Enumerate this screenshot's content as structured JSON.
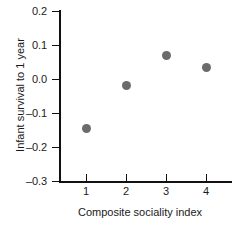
{
  "chart_data": {
    "type": "scatter",
    "title": "",
    "xlabel": "Composite sociality index",
    "ylabel": "Infant survival to 1 year",
    "x": [
      1,
      2,
      3,
      4
    ],
    "values": [
      -0.147,
      -0.018,
      0.068,
      0.035
    ],
    "series": [
      {
        "name": "Infant survival",
        "points": [
          {
            "x": 1,
            "y": -0.147
          },
          {
            "x": 2,
            "y": -0.018
          },
          {
            "x": 3,
            "y": 0.068
          },
          {
            "x": 4,
            "y": 0.035
          }
        ]
      }
    ],
    "xlim": [
      0.5,
      4.8
    ],
    "ylim": [
      -0.3,
      0.2
    ],
    "xticks": [
      1,
      2,
      3,
      4
    ],
    "yticks": [
      0.2,
      0.1,
      0.0,
      -0.1,
      -0.2,
      -0.3
    ],
    "xtick_labels": [
      "1",
      "2",
      "3",
      "4"
    ],
    "ytick_labels": [
      "0.2",
      "0.1",
      "0.0",
      "–0.1",
      "–0.2",
      "–0.3"
    ],
    "grid": false,
    "legend": "none",
    "marker_color": "#6b6b6b",
    "axis_color": "#111111",
    "background_color": "#ffffff"
  }
}
